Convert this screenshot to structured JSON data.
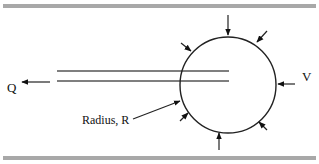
{
  "diagram": {
    "labels": {
      "flow": "Q",
      "velocity": "V",
      "radius": "Radius, R"
    },
    "colors": {
      "border_bar": "#a8a8a8",
      "lines": "#222222",
      "tube": "#555555"
    },
    "elements": {
      "circle": {
        "cx": 228,
        "cy": 85,
        "r": 48
      },
      "tube_lines_y": [
        71,
        81
      ],
      "inward_arrows": 8
    }
  }
}
